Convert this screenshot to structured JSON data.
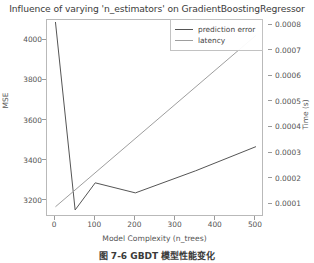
{
  "chart_data": {
    "type": "line",
    "title": "Influence of varying 'n_estimators' on GradientBoostingRegressor",
    "xlabel": "Model Complexity (n_trees)",
    "ylabel_left": "MSE",
    "ylabel_right": "Time (s)",
    "xlim": [
      -20,
      520
    ],
    "xticks": [
      0,
      100,
      200,
      300,
      400,
      500
    ],
    "xtick_labels": [
      "0",
      "100",
      "200",
      "300",
      "400",
      "500"
    ],
    "ylim_left": [
      3120,
      4100
    ],
    "yticks_left": [
      3200,
      3400,
      3600,
      3800,
      4000
    ],
    "ytick_labels_left": [
      "3200",
      "3400",
      "3600",
      "3800",
      "4000"
    ],
    "ylim_right": [
      5e-05,
      0.00082
    ],
    "yticks_right": [
      0.0001,
      0.0002,
      0.0003,
      0.0004,
      0.0005,
      0.0006,
      0.0007,
      0.0008
    ],
    "ytick_labels_right": [
      "0.0001",
      "0.0002",
      "0.0003",
      "0.0004",
      "0.0005",
      "0.0006",
      "0.0007",
      "0.0008"
    ],
    "grid": false,
    "legend_position": "upper right",
    "series": [
      {
        "name": "prediction error",
        "axis": "left",
        "color": "#555555",
        "x": [
          1,
          50,
          100,
          200,
          350,
          500
        ],
        "y": [
          4090,
          3155,
          3290,
          3240,
          3350,
          3470
        ]
      },
      {
        "name": "latency",
        "axis": "right",
        "color": "#9e9e9e",
        "x": [
          1,
          500
        ],
        "y": [
          9e-05,
          0.00076
        ]
      }
    ]
  },
  "legend": {
    "items": [
      {
        "label": "prediction error",
        "color": "#555555"
      },
      {
        "label": "latency",
        "color": "#9e9e9e"
      }
    ]
  },
  "caption": {
    "text": "图 7-6   GBDT 模型性能变化"
  }
}
